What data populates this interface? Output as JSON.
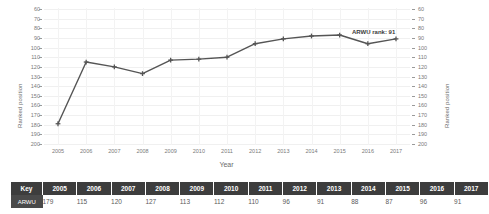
{
  "chart_data": {
    "type": "line",
    "title": "",
    "xlabel": "Year",
    "ylabel": "Ranked position",
    "ylabel_right": "Ranked position",
    "x": [
      2005,
      2006,
      2007,
      2008,
      2009,
      2010,
      2011,
      2012,
      2013,
      2014,
      2015,
      2016,
      2017
    ],
    "categories": [
      "2005",
      "2006",
      "2007",
      "2008",
      "2009",
      "2010",
      "2011",
      "2012",
      "2013",
      "2014",
      "2015",
      "2016",
      "2017"
    ],
    "series": [
      {
        "name": "ARWU",
        "values": [
          179,
          115,
          120,
          127,
          113,
          112,
          110,
          96,
          91,
          88,
          87,
          96,
          91
        ]
      }
    ],
    "values": [
      179,
      115,
      120,
      127,
      113,
      112,
      110,
      96,
      91,
      88,
      87,
      96,
      91
    ],
    "ylim": [
      60,
      200
    ],
    "y_inverted": true,
    "yticks": [
      60,
      70,
      80,
      90,
      100,
      110,
      120,
      130,
      140,
      150,
      160,
      170,
      180,
      190,
      200
    ],
    "ytick_labels": [
      "60",
      "70",
      "80",
      "90",
      "100",
      "110",
      "120",
      "130",
      "140",
      "150",
      "160",
      "170",
      "180",
      "190",
      "200"
    ],
    "xtick_labels": [
      "2005",
      "2006",
      "2007",
      "2008",
      "2009",
      "2010",
      "2011",
      "2012",
      "2013",
      "2014",
      "2015",
      "2016",
      "2017"
    ],
    "grid": true,
    "legend": "none",
    "annotations": [
      {
        "text": "ARWU rank: 91",
        "x": 2017,
        "y": 91
      }
    ],
    "line_color": "#555555",
    "marker": "plus"
  },
  "annotation_label": "ARWU rank: 91",
  "key_table": {
    "header": [
      "Key",
      "2005",
      "2006",
      "2007",
      "2008",
      "2009",
      "2010",
      "2011",
      "2012",
      "2013",
      "2014",
      "2015",
      "2016",
      "2017"
    ],
    "rows": [
      {
        "label": "ARWU",
        "values": [
          "179",
          "115",
          "120",
          "127",
          "113",
          "112",
          "110",
          "96",
          "91",
          "88",
          "87",
          "96",
          "91"
        ]
      }
    ]
  },
  "colors": {
    "line": "#555555",
    "header_bg": "#3d3d3d",
    "key_bg": "#4a4a4a",
    "grid": "#f0f0f0",
    "tick_text": "#7a7a7a"
  }
}
